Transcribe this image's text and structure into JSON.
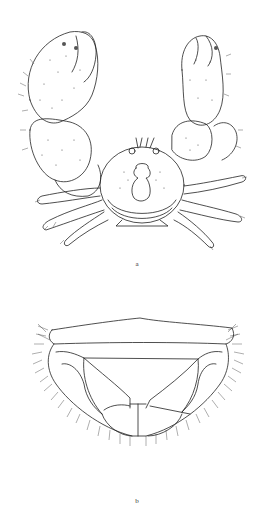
{
  "plate": {
    "figures": [
      {
        "id": "a",
        "label": "a",
        "subject": "crab-dorsal-view"
      },
      {
        "id": "b",
        "label": "b",
        "subject": "carapace-detail-with-setae"
      }
    ]
  },
  "colors": {
    "background": "#ffffff",
    "ink": "#222222",
    "stipple": "#555555"
  }
}
